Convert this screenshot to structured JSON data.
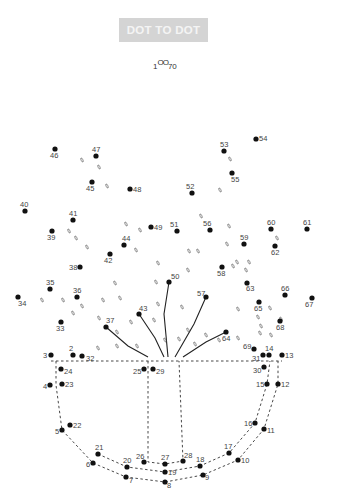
{
  "header": {
    "title": "DOT TO DOT",
    "start_label": "1",
    "start_circles": "OO",
    "end_label": "70"
  },
  "colors": {
    "badge_bg": "#d4d4d4",
    "badge_text": "#f4f4f4",
    "dot": "#111111",
    "label": "#444444",
    "guide": "#333333"
  },
  "dots": [
    {
      "n": "2",
      "x": 73,
      "y": 355,
      "lx": 69,
      "ly": 351
    },
    {
      "n": "3",
      "x": 51,
      "y": 355,
      "lx": 43,
      "ly": 358
    },
    {
      "n": "4",
      "x": 50,
      "y": 385,
      "lx": 43,
      "ly": 389
    },
    {
      "n": "5",
      "x": 62,
      "y": 430,
      "lx": 55,
      "ly": 434
    },
    {
      "n": "6",
      "x": 93,
      "y": 463,
      "lx": 86,
      "ly": 467
    },
    {
      "n": "7",
      "x": 126,
      "y": 477,
      "lx": 129,
      "ly": 483
    },
    {
      "n": "8",
      "x": 165,
      "y": 482,
      "lx": 167,
      "ly": 488
    },
    {
      "n": "9",
      "x": 203,
      "y": 475,
      "lx": 205,
      "ly": 480
    },
    {
      "n": "10",
      "x": 238,
      "y": 460,
      "lx": 241,
      "ly": 463
    },
    {
      "n": "11",
      "x": 264,
      "y": 429,
      "lx": 267,
      "ly": 433
    },
    {
      "n": "12",
      "x": 278,
      "y": 384,
      "lx": 281,
      "ly": 387
    },
    {
      "n": "13",
      "x": 282,
      "y": 355,
      "lx": 285,
      "ly": 358
    },
    {
      "n": "14",
      "x": 269,
      "y": 355,
      "lx": 265,
      "ly": 351
    },
    {
      "n": "15",
      "x": 267,
      "y": 384,
      "lx": 256,
      "ly": 387
    },
    {
      "n": "16",
      "x": 255,
      "y": 423,
      "lx": 244,
      "ly": 426
    },
    {
      "n": "17",
      "x": 229,
      "y": 453,
      "lx": 224,
      "ly": 449
    },
    {
      "n": "18",
      "x": 200,
      "y": 466,
      "lx": 196,
      "ly": 462
    },
    {
      "n": "19",
      "x": 165,
      "y": 472,
      "lx": 168,
      "ly": 475
    },
    {
      "n": "20",
      "x": 127,
      "y": 467,
      "lx": 123,
      "ly": 463
    },
    {
      "n": "21",
      "x": 98,
      "y": 454,
      "lx": 95,
      "ly": 450
    },
    {
      "n": "22",
      "x": 70,
      "y": 425,
      "lx": 73,
      "ly": 428
    },
    {
      "n": "23",
      "x": 62,
      "y": 384,
      "lx": 65,
      "ly": 387
    },
    {
      "n": "24",
      "x": 61,
      "y": 369,
      "lx": 64,
      "ly": 374
    },
    {
      "n": "25",
      "x": 144,
      "y": 369,
      "lx": 133,
      "ly": 374
    },
    {
      "n": "26",
      "x": 144,
      "y": 462,
      "lx": 136,
      "ly": 459
    },
    {
      "n": "27",
      "x": 165,
      "y": 464,
      "lx": 161,
      "ly": 460
    },
    {
      "n": "28",
      "x": 183,
      "y": 461,
      "lx": 184,
      "ly": 458
    },
    {
      "n": "29",
      "x": 153,
      "y": 369,
      "lx": 156,
      "ly": 374
    },
    {
      "n": "30",
      "x": 264,
      "y": 367,
      "lx": 253,
      "ly": 373
    },
    {
      "n": "31",
      "x": 263,
      "y": 355,
      "lx": 252,
      "ly": 361
    },
    {
      "n": "32",
      "x": 82,
      "y": 356,
      "lx": 86,
      "ly": 361
    },
    {
      "n": "33",
      "x": 61,
      "y": 322,
      "lx": 56,
      "ly": 331
    },
    {
      "n": "34",
      "x": 18,
      "y": 297,
      "lx": 18,
      "ly": 306
    },
    {
      "n": "35",
      "x": 50,
      "y": 289,
      "lx": 46,
      "ly": 285
    },
    {
      "n": "36",
      "x": 77,
      "y": 297,
      "lx": 73,
      "ly": 293
    },
    {
      "n": "37",
      "x": 106,
      "y": 327,
      "lx": 106,
      "ly": 323
    },
    {
      "n": "38",
      "x": 80,
      "y": 267,
      "lx": 69,
      "ly": 270
    },
    {
      "n": "39",
      "x": 52,
      "y": 231,
      "lx": 47,
      "ly": 240
    },
    {
      "n": "40",
      "x": 25,
      "y": 211,
      "lx": 20,
      "ly": 207
    },
    {
      "n": "41",
      "x": 73,
      "y": 220,
      "lx": 69,
      "ly": 216
    },
    {
      "n": "42",
      "x": 110,
      "y": 254,
      "lx": 104,
      "ly": 263
    },
    {
      "n": "43",
      "x": 139,
      "y": 314,
      "lx": 139,
      "ly": 311
    },
    {
      "n": "44",
      "x": 124,
      "y": 245,
      "lx": 122,
      "ly": 241
    },
    {
      "n": "45",
      "x": 92,
      "y": 182,
      "lx": 86,
      "ly": 191
    },
    {
      "n": "46",
      "x": 55,
      "y": 149,
      "lx": 50,
      "ly": 158
    },
    {
      "n": "47",
      "x": 96,
      "y": 156,
      "lx": 92,
      "ly": 152
    },
    {
      "n": "48",
      "x": 130,
      "y": 189,
      "lx": 133,
      "ly": 192
    },
    {
      "n": "49",
      "x": 151,
      "y": 227,
      "lx": 154,
      "ly": 230
    },
    {
      "n": "50",
      "x": 169,
      "y": 282,
      "lx": 171,
      "ly": 279
    },
    {
      "n": "51",
      "x": 177,
      "y": 231,
      "lx": 170,
      "ly": 227
    },
    {
      "n": "52",
      "x": 192,
      "y": 193,
      "lx": 186,
      "ly": 189
    },
    {
      "n": "53",
      "x": 224,
      "y": 151,
      "lx": 220,
      "ly": 147
    },
    {
      "n": "54",
      "x": 256,
      "y": 139,
      "lx": 259,
      "ly": 141
    },
    {
      "n": "55",
      "x": 232,
      "y": 173,
      "lx": 231,
      "ly": 182
    },
    {
      "n": "56",
      "x": 210,
      "y": 230,
      "lx": 203,
      "ly": 226
    },
    {
      "n": "57",
      "x": 206,
      "y": 297,
      "lx": 197,
      "ly": 296
    },
    {
      "n": "58",
      "x": 222,
      "y": 267,
      "lx": 217,
      "ly": 276
    },
    {
      "n": "59",
      "x": 244,
      "y": 244,
      "lx": 240,
      "ly": 240
    },
    {
      "n": "60",
      "x": 271,
      "y": 229,
      "lx": 267,
      "ly": 225
    },
    {
      "n": "61",
      "x": 307,
      "y": 229,
      "lx": 303,
      "ly": 225
    },
    {
      "n": "62",
      "x": 275,
      "y": 246,
      "lx": 271,
      "ly": 255
    },
    {
      "n": "63",
      "x": 247,
      "y": 283,
      "lx": 246,
      "ly": 291
    },
    {
      "n": "64",
      "x": 226,
      "y": 332,
      "lx": 222,
      "ly": 341
    },
    {
      "n": "65",
      "x": 259,
      "y": 302,
      "lx": 254,
      "ly": 311
    },
    {
      "n": "66",
      "x": 285,
      "y": 295,
      "lx": 281,
      "ly": 291
    },
    {
      "n": "67",
      "x": 312,
      "y": 298,
      "lx": 305,
      "ly": 307
    },
    {
      "n": "68",
      "x": 280,
      "y": 321,
      "lx": 276,
      "ly": 330
    },
    {
      "n": "69",
      "x": 254,
      "y": 349,
      "lx": 243,
      "ly": 349
    }
  ],
  "guides": {
    "dashed": [
      [
        [
          51,
          361
        ],
        [
          282,
          361
        ]
      ],
      [
        [
          56,
          361
        ],
        [
          56,
          385
        ],
        [
          62,
          430
        ],
        [
          93,
          463
        ],
        [
          126,
          477
        ],
        [
          165,
          482
        ],
        [
          203,
          475
        ],
        [
          238,
          460
        ],
        [
          264,
          429
        ],
        [
          278,
          384
        ],
        [
          278,
          361
        ]
      ],
      [
        [
          148,
          361
        ],
        [
          148,
          462
        ],
        [
          165,
          464
        ],
        [
          183,
          461
        ],
        [
          179,
          361
        ]
      ],
      [
        [
          98,
          454
        ],
        [
          127,
          467
        ],
        [
          165,
          472
        ],
        [
          200,
          466
        ],
        [
          229,
          453
        ],
        [
          255,
          423
        ],
        [
          267,
          384
        ],
        [
          270,
          361
        ]
      ]
    ],
    "solid": [
      [
        [
          106,
          327
        ],
        [
          128,
          346
        ],
        [
          148,
          357
        ]
      ],
      [
        [
          139,
          314
        ],
        [
          155,
          338
        ],
        [
          164,
          357
        ]
      ],
      [
        [
          169,
          282
        ],
        [
          164,
          314
        ],
        [
          168,
          357
        ]
      ],
      [
        [
          206,
          297
        ],
        [
          194,
          324
        ],
        [
          175,
          357
        ]
      ],
      [
        [
          226,
          332
        ],
        [
          206,
          342
        ],
        [
          183,
          357
        ]
      ]
    ]
  },
  "hint_marks": [
    [
      82,
      160
    ],
    [
      99,
      167
    ],
    [
      107,
      186
    ],
    [
      76,
      238
    ],
    [
      87,
      247
    ],
    [
      126,
      224
    ],
    [
      140,
      230
    ],
    [
      136,
      250
    ],
    [
      158,
      263
    ],
    [
      156,
      282
    ],
    [
      115,
      283
    ],
    [
      120,
      298
    ],
    [
      103,
      300
    ],
    [
      82,
      306
    ],
    [
      99,
      318
    ],
    [
      117,
      332
    ],
    [
      131,
      322
    ],
    [
      154,
      320
    ],
    [
      98,
      348
    ],
    [
      117,
      346
    ],
    [
      137,
      346
    ],
    [
      165,
      340
    ],
    [
      158,
      304
    ],
    [
      182,
      307
    ],
    [
      188,
      330
    ],
    [
      179,
      339
    ],
    [
      195,
      344
    ],
    [
      206,
      335
    ],
    [
      219,
      340
    ],
    [
      238,
      338
    ],
    [
      260,
      333
    ],
    [
      258,
      317
    ],
    [
      270,
      308
    ],
    [
      281,
      319
    ],
    [
      246,
      270
    ],
    [
      249,
      262
    ],
    [
      237,
      262
    ],
    [
      229,
      226
    ],
    [
      227,
      244
    ],
    [
      220,
      190
    ],
    [
      230,
      159
    ],
    [
      201,
      216
    ],
    [
      189,
      251
    ],
    [
      188,
      270
    ],
    [
      198,
      251
    ],
    [
      277,
      238
    ],
    [
      238,
      309
    ],
    [
      261,
      326
    ],
    [
      271,
      335
    ],
    [
      42,
      300
    ],
    [
      63,
      300
    ],
    [
      73,
      313
    ],
    [
      69,
      231
    ],
    [
      233,
      266
    ]
  ]
}
